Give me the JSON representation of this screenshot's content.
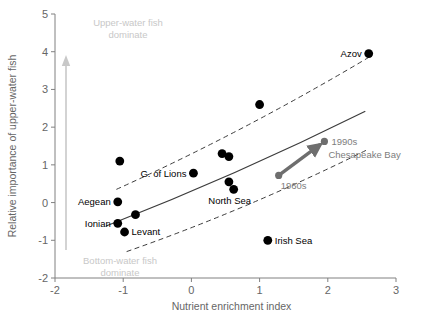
{
  "chart_data": {
    "type": "scatter",
    "title": "",
    "xlabel": "Nutrient enrichment index",
    "ylabel": "Relative importance of upper-water fish",
    "xlim": [
      -2,
      3
    ],
    "ylim": [
      -2,
      5
    ],
    "xticks": [
      "-2",
      "-1",
      "0",
      "1",
      "2",
      "3"
    ],
    "yticks": [
      "-2",
      "-1",
      "0",
      "1",
      "2",
      "3",
      "4",
      "5"
    ],
    "grid": false,
    "legend": "none",
    "points": [
      {
        "x": -1.05,
        "y": 1.1,
        "label": ""
      },
      {
        "x": -1.08,
        "y": 0.02,
        "label": "Aegean",
        "label_side": "left"
      },
      {
        "x": -1.08,
        "y": -0.55,
        "label": "Ionian",
        "label_side": "left"
      },
      {
        "x": -0.98,
        "y": -0.78,
        "label": "Levant",
        "label_side": "right"
      },
      {
        "x": -0.82,
        "y": -0.32,
        "label": ""
      },
      {
        "x": 0.03,
        "y": 0.78,
        "label": "G. of Lions",
        "label_side": "left"
      },
      {
        "x": 0.55,
        "y": 0.55,
        "label": ""
      },
      {
        "x": 0.62,
        "y": 0.35,
        "label": "North Sea",
        "label_side": "below"
      },
      {
        "x": 0.45,
        "y": 1.3,
        "label": ""
      },
      {
        "x": 0.55,
        "y": 1.22,
        "label": ""
      },
      {
        "x": 1.0,
        "y": 2.6,
        "label": ""
      },
      {
        "x": 1.12,
        "y": -1.0,
        "label": "Irish Sea",
        "label_side": "right"
      },
      {
        "x": 2.6,
        "y": 3.95,
        "label": "Azov",
        "label_side": "left"
      }
    ],
    "trajectory": {
      "name": "Chesapeake Bay",
      "color": "#6e6e6e",
      "start": {
        "x": 1.28,
        "y": 0.72,
        "label": "1960s"
      },
      "end": {
        "x": 1.95,
        "y": 1.62,
        "label": "1990s"
      }
    },
    "regression": {
      "style": "solid",
      "color": "#3c3c3c",
      "x_start": -1.25,
      "y_start": -0.62,
      "x_end": 2.55,
      "y_end": 2.42
    },
    "confidence_bands": {
      "style": "dashed",
      "color": "#3c3c3c",
      "upper": {
        "x_start": -1.1,
        "y_start": 0.35,
        "x_end": 2.6,
        "y_end": 3.85
      },
      "lower": {
        "x_start": -0.95,
        "y_start": -1.3,
        "x_end": 2.6,
        "y_end": 1.42
      }
    },
    "annotations": {
      "top_zone": "Upper-water fish\ndominate",
      "top_zone_line1": "Upper-water fish",
      "top_zone_line2": "dominate",
      "bottom_zone_line1": "Bottom-water fish",
      "bottom_zone_line2": "dominate",
      "arrow_color": "#c8c8c8"
    },
    "caption": ""
  },
  "colors": {
    "point": "#000000",
    "axis": "#808080",
    "trajectory": "#6e6e6e",
    "zone_text": "#c8c8c8"
  }
}
